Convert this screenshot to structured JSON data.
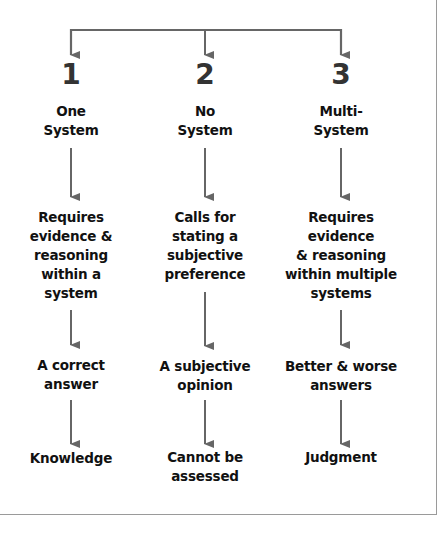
{
  "diagram": {
    "colors": {
      "arrow": "#666666",
      "number": "#333333",
      "text": "#111111"
    },
    "columns": [
      {
        "number": "1",
        "title": "One\nSystem",
        "requirement": "Requires\nevidence &\nreasoning\nwithin a\nsystem",
        "outcome": "A correct\nanswer",
        "result": "Knowledge"
      },
      {
        "number": "2",
        "title": "No\nSystem",
        "requirement": "Calls for\nstating a\nsubjective\npreference",
        "outcome": "A subjective\nopinion",
        "result": "Cannot be\nassessed"
      },
      {
        "number": "3",
        "title": "Multi-\nSystem",
        "requirement": "Requires\nevidence\n& reasoning\nwithin multiple\nsystems",
        "outcome": "Better & worse\nanswers",
        "result": "Judgment"
      }
    ]
  }
}
